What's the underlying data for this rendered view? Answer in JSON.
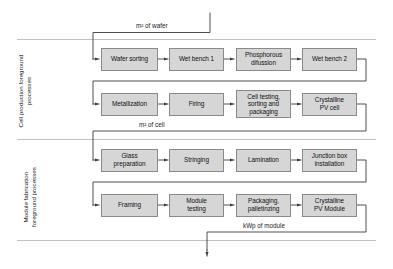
{
  "diagram": {
    "colors": {
      "box_fill": "#d6d6d6",
      "box_border": "#8a8a8a",
      "line": "#3c3c3c",
      "band_divider": "#b3b3b3",
      "text": "#111111",
      "background": "#ffffff"
    },
    "bands": [
      {
        "id": "cell-production",
        "label": "Cell production foreground\nprocesses",
        "label_line_1": "Cell production foreground",
        "label_line_2": "processes"
      },
      {
        "id": "module-fabrication",
        "label": "Module fabrication\nforeground processes",
        "label_line_1": "Module fabrication",
        "label_line_2": "foreground processes"
      }
    ],
    "flow_labels": [
      {
        "id": "input-wafer",
        "text": "m² of wafer"
      },
      {
        "id": "cell-to-module",
        "text": "m² of cell"
      },
      {
        "id": "output-module",
        "text": "kWp of module"
      }
    ],
    "rows": [
      {
        "id": "row-cell-1",
        "boxes": [
          {
            "id": "wafer-sorting",
            "label": "Wafer sorting"
          },
          {
            "id": "wet-bench-1",
            "label": "Wet bench 1"
          },
          {
            "id": "phosphorous-difussion",
            "label": "Phosphorous\ndifussion"
          },
          {
            "id": "wet-bench-2",
            "label": "Wet bench 2"
          }
        ]
      },
      {
        "id": "row-cell-2",
        "boxes": [
          {
            "id": "metallization",
            "label": "Metallization"
          },
          {
            "id": "firing",
            "label": "Firing"
          },
          {
            "id": "cell-testing-sorting-packaging",
            "label": "Cell testing,\nsorting and\npackaging"
          },
          {
            "id": "crystalline-pv-cell",
            "label": "Crystalline\nPV cell"
          }
        ]
      },
      {
        "id": "row-module-1",
        "boxes": [
          {
            "id": "glass-preparation",
            "label": "Glass\npreparation"
          },
          {
            "id": "stringing",
            "label": "Stringing"
          },
          {
            "id": "lamination",
            "label": "Lamination"
          },
          {
            "id": "junction-box-installation",
            "label": "Junction box\ninstallation"
          }
        ]
      },
      {
        "id": "row-module-2",
        "boxes": [
          {
            "id": "framing",
            "label": "Framing"
          },
          {
            "id": "module-testing",
            "label": "Module\ntesting"
          },
          {
            "id": "packaging-palletinzing",
            "label": "Packaging,\npalletinzing"
          },
          {
            "id": "crystalline-pv-module",
            "label": "Crystalline\nPV Module"
          }
        ]
      }
    ]
  }
}
